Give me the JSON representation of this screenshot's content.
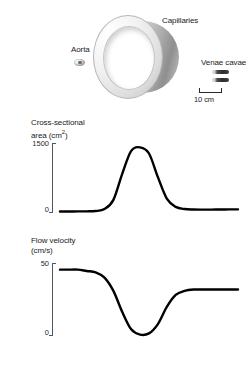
{
  "figure": {
    "background_color": "#ffffff"
  },
  "vessel_labels": {
    "aorta": "Aorta",
    "capillaries": "Capillaries",
    "venae_cavae": "Venae cavae"
  },
  "scale": {
    "label": "10 cm",
    "bar_length_px": 23
  },
  "icons": {
    "aorta": "aorta-cross-section-icon",
    "capillaries": "capillary-cylinder-icon",
    "venae_cavae": "venae-cavae-cross-section-icon",
    "scale_bar": "scale-bar-icon"
  },
  "chart_data": [
    {
      "type": "line",
      "name": "cross-sectional-area",
      "title": "Cross-sectional",
      "ylabel_line1": "Cross-sectional",
      "ylabel_line2": "area (cm2)",
      "ylabel_superscript": "2",
      "yunit": "cm2",
      "ytick_labels": [
        "1500",
        "0"
      ],
      "ytick_values": [
        1500,
        0
      ],
      "ylim": [
        0,
        1600
      ],
      "xlabel": "",
      "grid": false,
      "legend": false,
      "x": [
        0,
        5,
        10,
        15,
        20,
        25,
        30,
        35,
        40,
        45,
        50,
        55,
        60,
        65,
        70,
        75,
        80,
        85,
        90,
        95,
        100
      ],
      "values": [
        35,
        35,
        36,
        38,
        45,
        90,
        300,
        900,
        1420,
        1500,
        1360,
        820,
        330,
        140,
        90,
        80,
        78,
        78,
        80,
        82,
        84
      ],
      "annotation": "Sharp peak in total cross-sectional area at the capillaries"
    },
    {
      "type": "line",
      "name": "flow-velocity",
      "title": "Flow velocity",
      "ylabel_line1": "Flow velocity",
      "ylabel_line2": "(cm/s)",
      "yunit": "cm/s",
      "ytick_labels": [
        "50",
        "0"
      ],
      "ytick_values": [
        50,
        0
      ],
      "ylim": [
        0,
        55
      ],
      "xlabel": "",
      "grid": false,
      "legend": false,
      "x": [
        0,
        5,
        10,
        15,
        20,
        25,
        30,
        35,
        40,
        45,
        50,
        55,
        60,
        65,
        70,
        75,
        80,
        85,
        90,
        95,
        100
      ],
      "values": [
        50,
        50,
        50,
        49,
        48,
        44,
        34,
        18,
        5,
        1,
        2,
        9,
        22,
        31,
        34,
        35,
        35,
        35,
        35,
        35,
        35
      ],
      "annotation": "Flow velocity falls to a minimum in the capillaries then partially recovers"
    }
  ]
}
